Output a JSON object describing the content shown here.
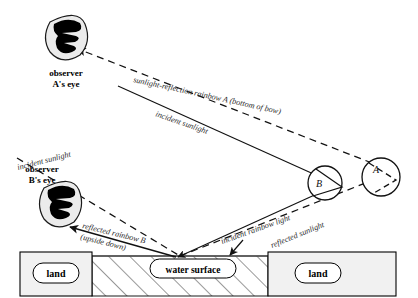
{
  "diagram": {
    "colors": {
      "ink": "#000000",
      "ray_solid": "#1a1a1a",
      "ray_dashed": "#1a1a1a",
      "land_fill": "#f0f0f0",
      "land_stroke": "#000000",
      "water_hatch": "#3a3a3a",
      "eye_ink": "#000000",
      "eye_halo": "#e8e8e8",
      "background": "#ffffff"
    },
    "observers": [
      {
        "id": "observer-a",
        "label_line1": "observer",
        "label_line2": "A's eye"
      },
      {
        "id": "observer-b",
        "label_line1": "observer",
        "label_line2": "B's eye"
      }
    ],
    "raindrops": [
      {
        "id": "drop-a",
        "label": "A",
        "path_style": "dashed"
      },
      {
        "id": "drop-b",
        "label": "B",
        "path_style": "solid"
      }
    ],
    "ray_labels": [
      {
        "id": "ray-sunlight-reflection-rainbow-a",
        "text": "sunlight-reflection rainbow A (bottom of bow)",
        "style": "dashed"
      },
      {
        "id": "ray-incident-sunlight-a",
        "text": "incident sunlight",
        "style": "solid"
      },
      {
        "id": "ray-incident-sunlight-b",
        "text": "incident sunlight",
        "style": "dashed"
      },
      {
        "id": "ray-incident-rainbow-light",
        "text": "incident rainbow light",
        "style": "solid"
      },
      {
        "id": "ray-reflected-sunlight",
        "text": "reflected sunlight",
        "style": "dashed"
      },
      {
        "id": "ray-reflected-rainbow-b-line1",
        "text": "reflected rainbow B",
        "style": "solid"
      },
      {
        "id": "ray-reflected-rainbow-b-line2",
        "text": "(upside down)",
        "style": "solid"
      }
    ],
    "ground": {
      "land_left_label": "land",
      "land_right_label": "land",
      "water_label": "water surface"
    }
  }
}
